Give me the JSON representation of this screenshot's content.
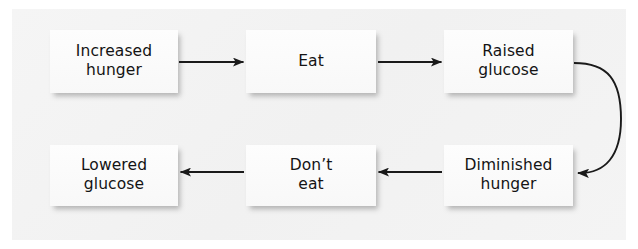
{
  "figure": {
    "type": "flowchart",
    "title": "",
    "orientation": "two-row-cycle",
    "background_color": "#f3f3f3",
    "node_fill_color": "#fbfbfb",
    "text_color": "#141414",
    "connector_color": "#1a1a1a"
  },
  "nodes": [
    {
      "id": "increased-hunger",
      "label": "Increased\nhunger",
      "row": 1,
      "order": 1
    },
    {
      "id": "eat",
      "label": "Eat",
      "row": 1,
      "order": 2
    },
    {
      "id": "raised-glucose",
      "label": "Raised\nglucose",
      "row": 1,
      "order": 3
    },
    {
      "id": "diminished-hunger",
      "label": "Diminished\nhunger",
      "row": 2,
      "order": 4
    },
    {
      "id": "dont-eat",
      "label": "Don’t\neat",
      "row": 2,
      "order": 5
    },
    {
      "id": "lowered-glucose",
      "label": "Lowered\nglucose",
      "row": 2,
      "order": 6
    }
  ],
  "connectors": [
    {
      "id": "increased-hunger-to-eat",
      "from": "increased-hunger",
      "to": "eat",
      "shape": "straight",
      "direction": "right"
    },
    {
      "id": "eat-to-raised-glucose",
      "from": "eat",
      "to": "raised-glucose",
      "shape": "straight",
      "direction": "right"
    },
    {
      "id": "raised-glucose-to-diminished-hunger",
      "from": "raised-glucose",
      "to": "diminished-hunger",
      "shape": "curved",
      "direction": "down-left"
    },
    {
      "id": "diminished-hunger-to-dont-eat",
      "from": "diminished-hunger",
      "to": "dont-eat",
      "shape": "straight",
      "direction": "left"
    },
    {
      "id": "dont-eat-to-lowered-glucose",
      "from": "dont-eat",
      "to": "lowered-glucose",
      "shape": "straight",
      "direction": "left"
    }
  ]
}
